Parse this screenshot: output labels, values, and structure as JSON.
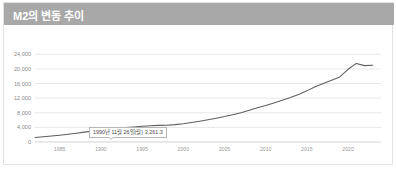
{
  "header": {
    "title": "M2의 변동 추이",
    "background_color": "#a8a8a8",
    "text_color": "#ffffff"
  },
  "annotation": {
    "label": "1990년 11월 26일(월) 3,261.3"
  },
  "chart_data": {
    "type": "line",
    "title": "M2의 변동 추이",
    "xlabel": "",
    "ylabel": "",
    "grid": true,
    "legend": false,
    "line_color": "#5e5e5e",
    "xlim": [
      1982,
      2024
    ],
    "ylim": [
      0,
      26000
    ],
    "yticks": [
      0,
      4000,
      8000,
      12000,
      16000,
      20000,
      24000
    ],
    "ytick_labels": [
      "0",
      "4,000",
      "8,000",
      "12,000",
      "16,000",
      "20,000",
      "24,000"
    ],
    "xticks": [
      1985,
      1990,
      1995,
      2000,
      2005,
      2010,
      2015,
      2020
    ],
    "xtick_labels": [
      "1985",
      "1990",
      "1995",
      "2000",
      "2005",
      "2010",
      "2015",
      "2020"
    ],
    "series": [
      {
        "name": "M2",
        "x": [
          1982,
          1983,
          1984,
          1985,
          1986,
          1987,
          1988,
          1989,
          1990,
          1991,
          1992,
          1993,
          1994,
          1995,
          1996,
          1997,
          1998,
          1999,
          2000,
          2001,
          2002,
          2003,
          2004,
          2005,
          2006,
          2007,
          2008,
          2009,
          2010,
          2011,
          2012,
          2013,
          2014,
          2015,
          2016,
          2017,
          2018,
          2019,
          2020,
          2021,
          2022,
          2023
        ],
        "values": [
          1250,
          1420,
          1620,
          1850,
          2100,
          2380,
          2700,
          3000,
          3261,
          3500,
          3750,
          3950,
          4100,
          4300,
          4450,
          4550,
          4600,
          4750,
          5000,
          5350,
          5700,
          6100,
          6500,
          6950,
          7450,
          8000,
          8700,
          9400,
          10000,
          10700,
          11400,
          12150,
          13000,
          14000,
          15100,
          16000,
          16900,
          17800,
          19900,
          21500,
          20900,
          21000
        ]
      }
    ],
    "annotations": [
      {
        "text": "1990년 11월 26일(월) 3,261.3",
        "x": 1990.9,
        "y": 3261.3
      }
    ]
  }
}
